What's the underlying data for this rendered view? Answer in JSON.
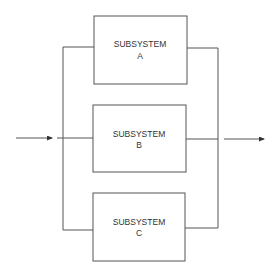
{
  "diagram": {
    "type": "parallel-redundancy-block-diagram",
    "colors": {
      "line": "#555555",
      "background": "#ffffff",
      "text": "#333333"
    },
    "subsystems": [
      {
        "id": "A",
        "line1": "SUBSYSTEM",
        "line2": "A"
      },
      {
        "id": "B",
        "line1": "SUBSYSTEM",
        "line2": "B"
      },
      {
        "id": "C",
        "line1": "SUBSYSTEM",
        "line2": "C"
      }
    ],
    "input": {
      "label": ""
    },
    "output": {
      "label": ""
    }
  }
}
